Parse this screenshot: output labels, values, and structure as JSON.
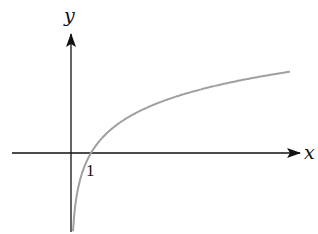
{
  "chart_data": {
    "type": "line",
    "title": "",
    "function": "y = ln(x)",
    "xlabel": "x",
    "ylabel": "y",
    "x_tick_labels": [
      "1"
    ],
    "annotations": [
      "curve crosses x-axis at x = 1"
    ],
    "grid": false,
    "legend": null,
    "xlim": [
      -3,
      11
    ],
    "ylim": [
      -2.4,
      3.5
    ],
    "series": [
      {
        "name": "ln(x)",
        "color": "#a0a0a0",
        "x": [
          0.1,
          0.2,
          0.5,
          1,
          2,
          3,
          4,
          5,
          6,
          7,
          8,
          9,
          10,
          11
        ],
        "values": [
          -2.3,
          -1.61,
          -0.69,
          0,
          0.69,
          1.1,
          1.39,
          1.61,
          1.79,
          1.95,
          2.08,
          2.2,
          2.3,
          2.4
        ]
      }
    ]
  },
  "labels": {
    "x_axis": "x",
    "y_axis": "y",
    "tick_one": "1"
  },
  "colors": {
    "axis": "#111111",
    "curve": "#a0a0a0"
  }
}
